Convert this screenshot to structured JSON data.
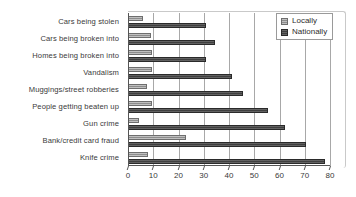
{
  "chart_data": {
    "type": "bar",
    "orientation": "horizontal",
    "title": "",
    "xlabel": "",
    "ylabel": "",
    "xlim": [
      0,
      80
    ],
    "xticks": [
      0,
      10,
      20,
      30,
      40,
      50,
      60,
      70,
      80
    ],
    "grid": true,
    "legend_position": "top-right",
    "categories": [
      "Cars being stolen",
      "Cars being broken into",
      "Homes being broken into",
      "Vandalism",
      "Muggings/street robberies",
      "People getting beaten up",
      "Gun crime",
      "Bank/credit card fraud",
      "Knife crime"
    ],
    "series": [
      {
        "name": "Locally",
        "color": "#8d8d8d",
        "values": [
          6,
          9,
          9.5,
          9.5,
          7.5,
          9.5,
          4.5,
          23,
          8
        ]
      },
      {
        "name": "Nationally",
        "color": "#3f3f3f",
        "values": [
          31,
          34.5,
          31,
          41,
          45.5,
          55.5,
          62,
          70.5,
          78
        ]
      }
    ]
  },
  "legend": {
    "entries": [
      {
        "label": "Locally",
        "swatch": "locally"
      },
      {
        "label": "Nationally",
        "swatch": "nationally"
      }
    ]
  }
}
